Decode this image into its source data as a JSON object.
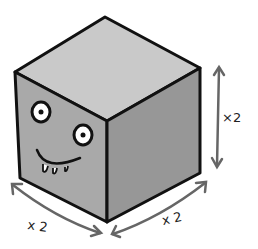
{
  "illustration": {
    "subject": "cube-with-face",
    "colors": {
      "top_face": "#c9c9c9",
      "left_face": "#a9a9a9",
      "right_face": "#979797",
      "outline": "#111111",
      "arrow": "#666666",
      "eye_white": "#ffffff"
    },
    "labels": {
      "height": "×2",
      "width_left": "x 2",
      "width_right": "x 2"
    }
  }
}
